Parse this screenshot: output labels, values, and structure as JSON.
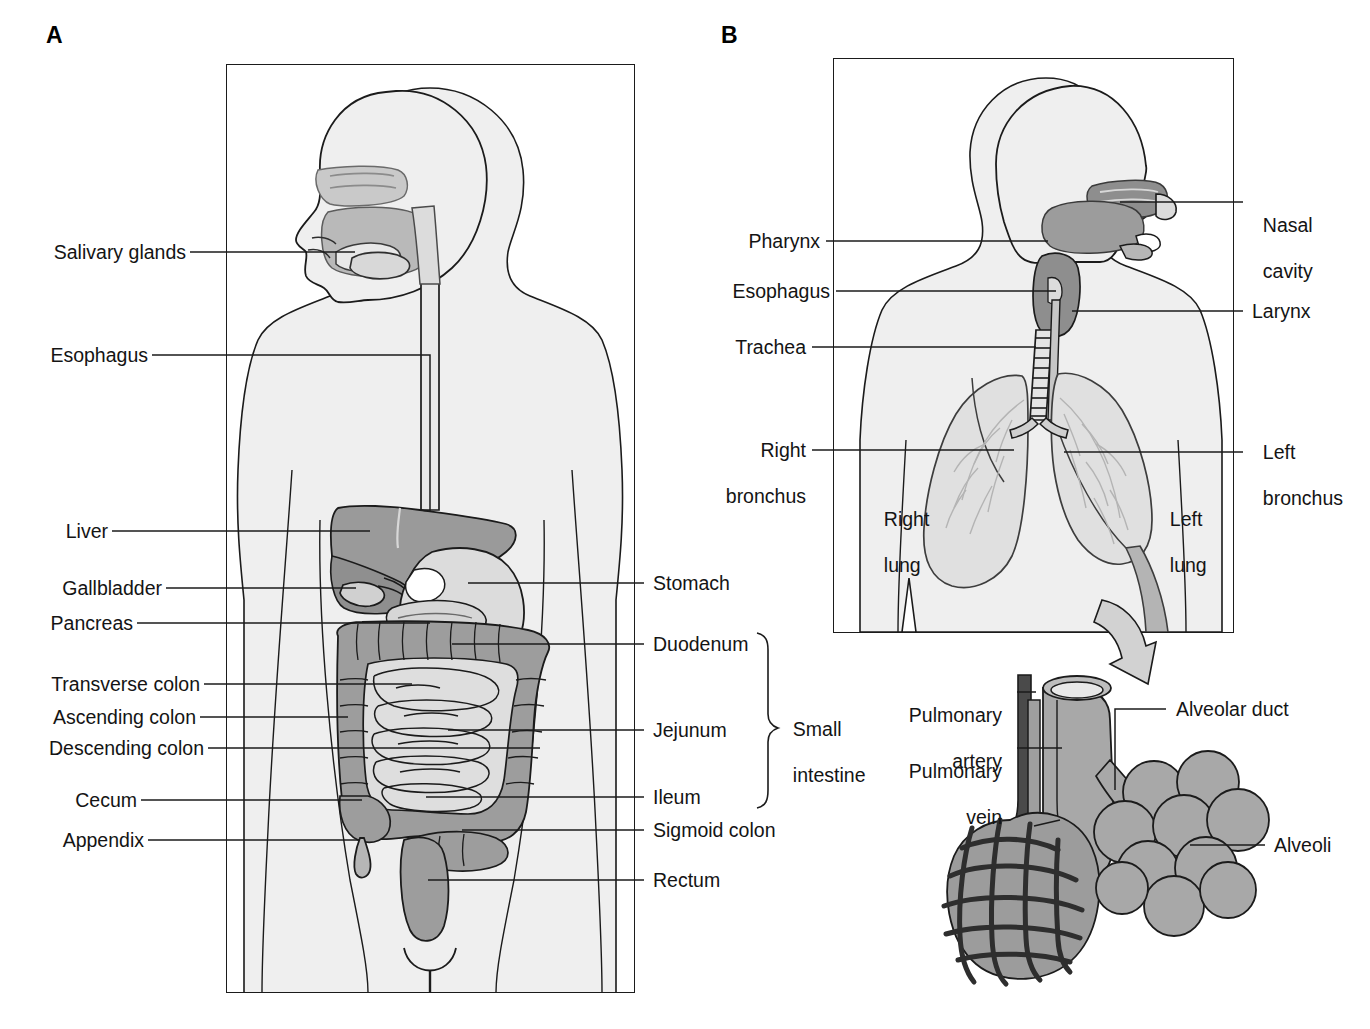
{
  "figure": {
    "panels": [
      {
        "id": "A",
        "letter": "A",
        "name": "digestive-system"
      },
      {
        "id": "B",
        "letter": "B",
        "name": "respiratory-system"
      }
    ]
  },
  "colors": {
    "outline": "#1b1b1b",
    "body_fill": "#efefef",
    "organ_light": "#e2e2e2",
    "organ_mid": "#b5b5b5",
    "organ_dark": "#8d8d8d",
    "organ_darkest": "#6e6e6e",
    "vessel_dark": "#4a4a4a",
    "white": "#ffffff",
    "text": "#141414"
  },
  "panelA": {
    "letter": "A",
    "labels_left": [
      {
        "key": "salivary-glands",
        "text": "Salivary glands"
      },
      {
        "key": "esophagus",
        "text": "Esophagus"
      },
      {
        "key": "liver",
        "text": "Liver"
      },
      {
        "key": "gallbladder",
        "text": "Gallbladder"
      },
      {
        "key": "pancreas",
        "text": "Pancreas"
      },
      {
        "key": "transverse-colon",
        "text": "Transverse colon"
      },
      {
        "key": "ascending-colon",
        "text": "Ascending colon"
      },
      {
        "key": "descending-colon",
        "text": "Descending colon"
      },
      {
        "key": "cecum",
        "text": "Cecum"
      },
      {
        "key": "appendix",
        "text": "Appendix"
      }
    ],
    "labels_right": [
      {
        "key": "stomach",
        "text": "Stomach"
      },
      {
        "key": "duodenum",
        "text": "Duodenum"
      },
      {
        "key": "jejunum",
        "text": "Jejunum"
      },
      {
        "key": "ileum",
        "text": "Ileum"
      },
      {
        "key": "sigmoid-colon",
        "text": "Sigmoid colon"
      },
      {
        "key": "rectum",
        "text": "Rectum"
      }
    ],
    "brace_label": {
      "key": "small-intestine",
      "line1": "Small",
      "line2": "intestine"
    }
  },
  "panelB": {
    "letter": "B",
    "labels_left": [
      {
        "key": "pharynx",
        "text": "Pharynx"
      },
      {
        "key": "esophagus",
        "text": "Esophagus"
      },
      {
        "key": "trachea",
        "text": "Trachea"
      },
      {
        "key": "right-bronchus",
        "line1": "Right",
        "line2": "bronchus"
      }
    ],
    "labels_right": [
      {
        "key": "nasal-cavity",
        "line1": "Nasal",
        "line2": "cavity"
      },
      {
        "key": "larynx",
        "text": "Larynx"
      },
      {
        "key": "left-bronchus",
        "line1": "Left",
        "line2": "bronchus"
      }
    ],
    "labels_inner": [
      {
        "key": "right-lung",
        "line1": "Right",
        "line2": "lung"
      },
      {
        "key": "left-lung",
        "line1": "Left",
        "line2": "lung"
      }
    ],
    "detail_labels_left": [
      {
        "key": "pulmonary-artery",
        "line1": "Pulmonary",
        "line2": "artery"
      },
      {
        "key": "pulmonary-vein",
        "line1": "Pulmonary",
        "line2": "vein"
      }
    ],
    "detail_labels_right": [
      {
        "key": "alveolar-duct",
        "text": "Alveolar duct"
      },
      {
        "key": "alveoli",
        "text": "Alveoli"
      }
    ],
    "magnify_arrow": {
      "key": "magnify-arrow-icon",
      "name": "magnify-arrow"
    }
  }
}
